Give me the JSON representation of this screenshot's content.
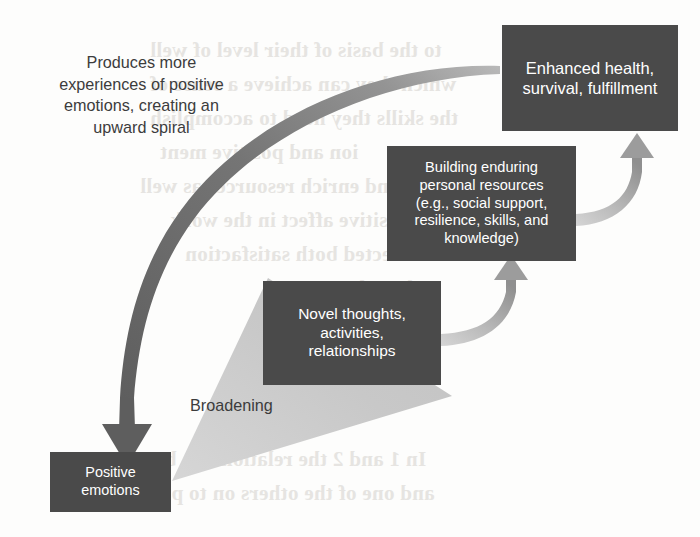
{
  "diagram": {
    "colors": {
      "box_fill": "#4a4a4a",
      "box_text": "#ffffff",
      "dark_arrow": "#6b6b6b",
      "light_arrow": "#b5b5b5",
      "wedge": "#c9c9c9",
      "caption_text": "#3c3c3c",
      "background": "#fdfdfc"
    },
    "nodes": [
      {
        "id": "positive-emotions",
        "label": "Positive\nemotions",
        "line1": "Positive",
        "line2": "emotions"
      },
      {
        "id": "novel-thoughts",
        "label": "Novel thoughts, activities, relationships",
        "line1": "Novel thoughts,",
        "line2": "activities,",
        "line3": "relationships"
      },
      {
        "id": "building-resources",
        "label": "Building enduring personal resources (e.g., social support, resilience, skills, and knowledge)",
        "line1": "Building enduring",
        "line2": "personal resources",
        "line3": "(e.g., social support,",
        "line4": "resilience, skills, and",
        "line5": "knowledge)"
      },
      {
        "id": "enhanced-health",
        "label": "Enhanced health, survival, fulfillment",
        "line1": "Enhanced health,",
        "line2": "survival, fulfillment"
      }
    ],
    "captions": {
      "spiral": {
        "line1": "Produces more",
        "line2": "experiences of positive",
        "line3": "emotions, creating an",
        "line4": "upward spiral",
        "full": "Produces more experiences of positive emotions, creating an upward spiral"
      },
      "broadening": "Broadening"
    },
    "connectors": [
      {
        "id": "broadening-wedge",
        "kind": "wedge",
        "from": "positive-emotions",
        "to": "novel-thoughts",
        "label": "Broadening"
      },
      {
        "id": "novel-to-building-arrow",
        "kind": "curved-arrow-up",
        "from": "novel-thoughts",
        "to": "building-resources"
      },
      {
        "id": "building-to-enhanced-arrow",
        "kind": "curved-arrow-up",
        "from": "building-resources",
        "to": "enhanced-health"
      },
      {
        "id": "spiral-return-arrow",
        "kind": "large-curved-arrow-down",
        "from": "enhanced-health",
        "to": "positive-emotions",
        "label": "Produces more experiences of positive emotions, creating an upward spiral"
      }
    ]
  },
  "bleed_text": {
    "lines": [
      "to the basis of their level of well",
      "which they can achieve a sense of",
      "the skills they need to accomplish",
      "ion and positive ment",
      "build and enrich resources as well",
      "with positive affect in the work",
      "affected both satisfaction",
      "boredom",
      "In 1 and 2 the relationship be",
      "and one of the others on to para"
    ]
  }
}
